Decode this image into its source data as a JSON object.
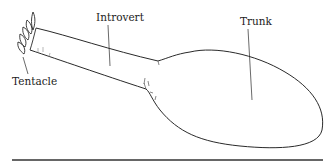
{
  "diagram": {
    "labels": {
      "tentacle": "Tentacle",
      "introvert": "Introvert",
      "trunk": "Trunk"
    },
    "colors": {
      "stroke": "#2a2a2a",
      "text": "#222222",
      "baseline": "#333333",
      "background": "#ffffff"
    }
  }
}
